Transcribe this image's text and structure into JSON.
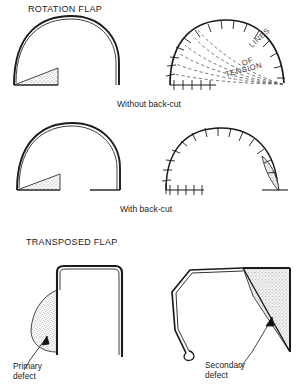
{
  "figure": {
    "background_color": "#ffffff",
    "ink_color": "#1b1b1b",
    "stipple_color": "#8d8d8d",
    "tension_line_color": "#5a5a5a"
  },
  "sections": {
    "rotation": {
      "title": "ROTATION FLAP",
      "caption_without": "Without back-cut",
      "caption_with": "With back-cut",
      "tension_label_line1": "LINES",
      "tension_label_line2": "OF",
      "tension_label_line3": "TENSION"
    },
    "transposed": {
      "title": "TRANSPOSED FLAP",
      "primary_label_line1": "Primary",
      "primary_label_line2": "defect",
      "secondary_label_line1": "Secondary",
      "secondary_label_line2": "defect"
    }
  },
  "panels": [
    {
      "id": "rotation-without-backcut-design",
      "row": 1,
      "column": "left",
      "description": "semicircular rotation flap outline with stippled triangular primary defect at lower left, no back-cut",
      "has_sutures": false,
      "has_stippled_defect": true,
      "defect_position": "lower-left"
    },
    {
      "id": "rotation-without-backcut-closed",
      "row": 1,
      "column": "right",
      "description": "sutured rotation flap with dashed lines of tension radiating from lower right",
      "has_sutures": true,
      "has_stippled_defect": false,
      "has_tension_lines": true,
      "suture_count_arc": 12,
      "suture_count_base": 5
    },
    {
      "id": "rotation-with-backcut-design",
      "row": 2,
      "column": "left",
      "description": "semicircular rotation flap outline with stippled triangular primary defect at lower left and a horizontal back-cut at lower right",
      "has_sutures": false,
      "has_stippled_defect": true,
      "has_backcut": true,
      "defect_position": "lower-left"
    },
    {
      "id": "rotation-with-backcut-closed",
      "row": 2,
      "column": "right",
      "description": "sutured rotation flap with stippled secondary defect at right and sutured back-cut at lower left",
      "has_sutures": true,
      "has_stippled_defect": true,
      "has_backcut": true,
      "defect_position": "right",
      "suture_count_arc": 14,
      "suture_count_base": 6
    },
    {
      "id": "transposed-flap-design",
      "row": 3,
      "column": "left",
      "description": "rectangular transposed flap outline with curved stippled primary defect on left margin and arrow pointing to it",
      "has_sutures": false,
      "has_stippled_defect": true,
      "has_arrow": true,
      "defect_position": "left"
    },
    {
      "id": "transposed-flap-transposed",
      "row": 3,
      "column": "right",
      "description": "transposed flap rotated into the defect leaving a stippled triangular secondary defect at upper right with arrow pointing to it",
      "has_sutures": false,
      "has_stippled_defect": true,
      "has_arrow": true,
      "defect_position": "upper-right"
    }
  ]
}
